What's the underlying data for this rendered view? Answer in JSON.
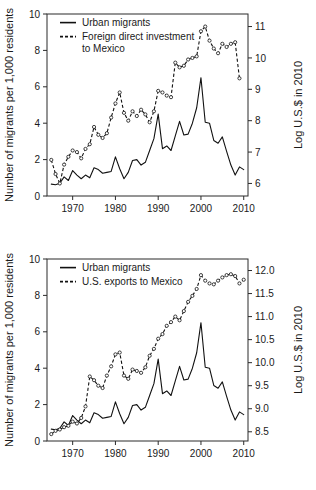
{
  "figure": {
    "name": "two-panel-time-series-figure",
    "width": 316,
    "height": 490,
    "background": "#ffffff",
    "line_color": "#111111"
  },
  "chart_data": [
    {
      "id": "panel-1",
      "type": "line",
      "title": "",
      "xlabel": "",
      "ylabel": "Number of migrants per 1,000 residents",
      "y2label": "Log U.S.$ in 2010",
      "xlim": [
        1964,
        2011
      ],
      "ylim": [
        0,
        10
      ],
      "y2lim": [
        5.6,
        11.4
      ],
      "grid": false,
      "legend_position": "top-left",
      "xticks": [
        1970,
        1980,
        1990,
        2000,
        2010
      ],
      "xticklabels": [
        "1970",
        "1980",
        "1990",
        "2000",
        "2010"
      ],
      "yticks": [
        0,
        2,
        4,
        6,
        8,
        10
      ],
      "yticklabels": [
        "0",
        "2",
        "4",
        "6",
        "8",
        "10"
      ],
      "y2ticks": [
        6,
        7,
        8,
        9,
        10,
        11
      ],
      "y2ticklabels": [
        "6",
        "7",
        "8",
        "9",
        "10",
        "11"
      ],
      "legend": [
        {
          "label": "Urban migrants",
          "style": "solid",
          "marker": false
        },
        {
          "label": "Foreign direct investment to Mexico",
          "style": "dashed",
          "marker": true
        }
      ],
      "series": [
        {
          "name": "Urban migrants",
          "axis": "left",
          "style": "solid",
          "marker": false,
          "x": [
            1965,
            1966,
            1967,
            1968,
            1969,
            1970,
            1971,
            1972,
            1973,
            1974,
            1975,
            1976,
            1977,
            1978,
            1979,
            1980,
            1981,
            1982,
            1983,
            1984,
            1985,
            1986,
            1987,
            1988,
            1989,
            1990,
            1991,
            1992,
            1993,
            1994,
            1995,
            1996,
            1997,
            1998,
            1999,
            2000,
            2001,
            2002,
            2003,
            2004,
            2005,
            2006,
            2007,
            2008,
            2009,
            2010
          ],
          "values": [
            0.65,
            0.62,
            0.7,
            1.05,
            0.85,
            1.4,
            1.15,
            0.95,
            1.15,
            1.0,
            1.55,
            1.45,
            1.25,
            1.3,
            1.35,
            2.15,
            1.5,
            0.95,
            1.3,
            1.95,
            2.0,
            1.7,
            1.85,
            2.5,
            3.15,
            4.5,
            2.6,
            2.75,
            2.5,
            3.3,
            4.1,
            3.35,
            3.4,
            4.0,
            4.85,
            6.5,
            4.05,
            4.0,
            3.05,
            2.9,
            3.25,
            2.45,
            1.7,
            1.15,
            1.6,
            1.45
          ]
        },
        {
          "name": "Foreign direct investment to Mexico",
          "axis": "right",
          "style": "dashed",
          "marker": true,
          "x": [
            1965,
            1966,
            1967,
            1968,
            1969,
            1970,
            1971,
            1972,
            1973,
            1974,
            1975,
            1976,
            1977,
            1978,
            1979,
            1980,
            1981,
            1982,
            1983,
            1984,
            1985,
            1986,
            1987,
            1988,
            1989,
            1990,
            1991,
            1992,
            1993,
            1994,
            1995,
            1996,
            1997,
            1998,
            1999,
            2000,
            2001,
            2002,
            2003,
            2004,
            2005,
            2006,
            2007,
            2008,
            2009
          ],
          "values": [
            6.75,
            6.3,
            6.0,
            6.6,
            6.85,
            7.05,
            7.0,
            6.8,
            7.1,
            7.25,
            7.8,
            7.55,
            7.45,
            7.6,
            8.1,
            8.55,
            8.9,
            8.25,
            8.0,
            8.3,
            8.15,
            8.35,
            8.2,
            7.95,
            8.3,
            8.95,
            8.9,
            8.8,
            8.75,
            9.85,
            9.7,
            9.75,
            9.95,
            10.0,
            10.05,
            10.85,
            11.0,
            10.55,
            10.3,
            10.15,
            10.45,
            10.35,
            10.45,
            10.5,
            9.35
          ]
        }
      ]
    },
    {
      "id": "panel-2",
      "type": "line",
      "title": "",
      "xlabel": "",
      "ylabel": "Number of migrants per 1,000 residents",
      "y2label": "Log U.S.$ in 2010",
      "xlim": [
        1964,
        2011
      ],
      "ylim": [
        0,
        10
      ],
      "y2lim": [
        8.3,
        12.25
      ],
      "grid": false,
      "legend_position": "top-left",
      "xticks": [
        1970,
        1980,
        1990,
        2000,
        2010
      ],
      "xticklabels": [
        "1970",
        "1980",
        "1990",
        "2000",
        "2010"
      ],
      "yticks": [
        0,
        2,
        4,
        6,
        8,
        10
      ],
      "yticklabels": [
        "0",
        "2",
        "4",
        "6",
        "8",
        "10"
      ],
      "y2ticks": [
        8.5,
        9.0,
        9.5,
        10.0,
        10.5,
        11.0,
        11.5,
        12.0
      ],
      "y2ticklabels": [
        "8.5",
        "9.0",
        "9.5",
        "10.0",
        "10.5",
        "11.0",
        "11.5",
        "12.0"
      ],
      "legend": [
        {
          "label": "Urban migrants",
          "style": "solid",
          "marker": false
        },
        {
          "label": "U.S. exports to Mexico",
          "style": "dashed",
          "marker": true
        }
      ],
      "series": [
        {
          "name": "Urban migrants",
          "axis": "left",
          "style": "solid",
          "marker": false,
          "x": [
            1965,
            1966,
            1967,
            1968,
            1969,
            1970,
            1971,
            1972,
            1973,
            1974,
            1975,
            1976,
            1977,
            1978,
            1979,
            1980,
            1981,
            1982,
            1983,
            1984,
            1985,
            1986,
            1987,
            1988,
            1989,
            1990,
            1991,
            1992,
            1993,
            1994,
            1995,
            1996,
            1997,
            1998,
            1999,
            2000,
            2001,
            2002,
            2003,
            2004,
            2005,
            2006,
            2007,
            2008,
            2009,
            2010
          ],
          "values": [
            0.65,
            0.62,
            0.7,
            1.05,
            0.85,
            1.4,
            1.15,
            0.95,
            1.15,
            1.0,
            1.55,
            1.45,
            1.25,
            1.3,
            1.35,
            2.15,
            1.5,
            0.95,
            1.3,
            1.95,
            2.0,
            1.7,
            1.85,
            2.5,
            3.15,
            4.5,
            2.6,
            2.75,
            2.5,
            3.3,
            4.1,
            3.35,
            3.4,
            4.0,
            4.85,
            6.5,
            4.05,
            4.0,
            3.05,
            2.9,
            3.25,
            2.45,
            1.7,
            1.15,
            1.6,
            1.45
          ]
        },
        {
          "name": "U.S. exports to Mexico",
          "axis": "right",
          "style": "dashed",
          "marker": true,
          "x": [
            1965,
            1966,
            1967,
            1968,
            1969,
            1970,
            1971,
            1972,
            1973,
            1974,
            1975,
            1976,
            1977,
            1978,
            1979,
            1980,
            1981,
            1982,
            1983,
            1984,
            1985,
            1986,
            1987,
            1988,
            1989,
            1990,
            1991,
            1992,
            1993,
            1994,
            1995,
            1996,
            1997,
            1998,
            1999,
            2000,
            2001,
            2002,
            2003,
            2004,
            2005,
            2006,
            2007,
            2008,
            2009,
            2010
          ],
          "values": [
            8.45,
            8.52,
            8.55,
            8.6,
            8.63,
            8.72,
            8.68,
            8.8,
            9.05,
            9.7,
            9.62,
            9.5,
            9.45,
            9.72,
            9.92,
            10.18,
            10.22,
            9.72,
            9.65,
            9.85,
            9.82,
            9.78,
            9.9,
            10.15,
            10.3,
            10.52,
            10.62,
            10.8,
            10.88,
            11.0,
            10.92,
            11.12,
            11.32,
            11.45,
            11.6,
            11.9,
            11.78,
            11.72,
            11.7,
            11.78,
            11.85,
            11.9,
            11.92,
            11.88,
            11.72,
            11.8
          ]
        }
      ]
    }
  ]
}
